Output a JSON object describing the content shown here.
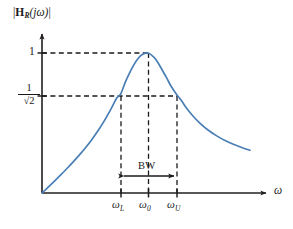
{
  "figure": {
    "background_color": "#ffffff",
    "axis_color": "#231f20",
    "curve_color": "#4a7fb5",
    "dash_color": "#1a1a1a"
  },
  "axes": {
    "ylabel_parts": {
      "bar_open": "|",
      "H": "H",
      "subscript": "R",
      "arg": "(jω)",
      "bar_close": "|"
    },
    "ylabel_text": "|H_R(jω)|",
    "xlabel": "ω",
    "y_ticks": [
      {
        "name": "one",
        "label": "1",
        "value": 1
      },
      {
        "name": "half-power",
        "label": "1/√2",
        "numerator": "1",
        "denominator": "√2",
        "value": 0.7071
      }
    ],
    "x_ticks": [
      {
        "name": "omega-lower",
        "symbol": "ω",
        "subscript": "L",
        "label": "ω_L"
      },
      {
        "name": "omega-center",
        "symbol": "ω",
        "subscript": "0",
        "label": "ω_0"
      },
      {
        "name": "omega-upper",
        "symbol": "ω",
        "subscript": "U",
        "label": "ω_U"
      }
    ]
  },
  "annotations": {
    "bandwidth_label": "BW"
  },
  "chart_data": {
    "type": "line",
    "xlabel": "ω",
    "ylabel": "|H_R(jω)|",
    "grid": false,
    "legend": null,
    "xlim": [
      0,
      1
    ],
    "ylim": [
      0,
      1.06
    ],
    "y_tick_values": [
      1,
      0.7071
    ],
    "y_tick_labels": [
      "1",
      "1/√2"
    ],
    "x_tick_values": [
      0.3785,
      0.5096,
      0.6456
    ],
    "x_tick_labels": [
      "ω_L",
      "ω_0",
      "ω_U"
    ],
    "markers": {
      "peak": {
        "x": 0.5096,
        "y": 1.0
      },
      "lower_cutoff": {
        "x": 0.3785,
        "y": 0.7071
      },
      "upper_cutoff": {
        "x": 0.6456,
        "y": 0.7071
      }
    },
    "bandwidth": {
      "from": 0.3785,
      "to": 0.6456,
      "label": "BW"
    },
    "series": [
      {
        "name": "|H_R(jω)|",
        "color": "#4a7fb5",
        "x": [
          0.0,
          0.03,
          0.06,
          0.09,
          0.12,
          0.15,
          0.18,
          0.21,
          0.24,
          0.27,
          0.3,
          0.33,
          0.36,
          0.3785,
          0.4,
          0.42,
          0.44,
          0.46,
          0.48,
          0.5096,
          0.54,
          0.56,
          0.58,
          0.6,
          0.62,
          0.6456,
          0.67,
          0.7,
          0.73,
          0.76,
          0.8,
          0.84,
          0.88,
          0.92,
          0.96,
          1.0
        ],
        "y": [
          0.0,
          0.042,
          0.085,
          0.129,
          0.175,
          0.222,
          0.272,
          0.325,
          0.383,
          0.446,
          0.517,
          0.596,
          0.68,
          0.7071,
          0.79,
          0.855,
          0.912,
          0.957,
          0.988,
          1.0,
          0.967,
          0.925,
          0.873,
          0.82,
          0.764,
          0.7071,
          0.66,
          0.596,
          0.543,
          0.498,
          0.448,
          0.408,
          0.375,
          0.348,
          0.325,
          0.305
        ]
      }
    ]
  }
}
